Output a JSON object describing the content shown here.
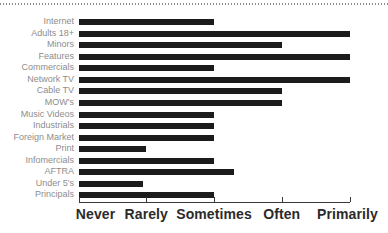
{
  "chart": {
    "type": "barh",
    "title": "",
    "xlabel": "",
    "ylabel": "",
    "grid": false,
    "legend": false
  },
  "chart_data": {
    "type": "bar",
    "orientation": "horizontal",
    "title": "",
    "xlabel": "",
    "ylabel": "",
    "grid": false,
    "legend": null,
    "xlim": [
      0,
      4
    ],
    "xtick_labels": [
      "Never",
      "Rarely",
      "Sometimes",
      "Often",
      "Primarily"
    ],
    "xtick_values": [
      0,
      1,
      2,
      3,
      4
    ],
    "categories": [
      "Internet",
      "Adults 18+",
      "Minors",
      "Features",
      "Commercials",
      "Network TV",
      "Cable TV",
      "MOW's",
      "Music Videos",
      "Industrials",
      "Foreign Market",
      "Print",
      "Infomercials",
      "AFTRA",
      "Under 5's",
      "Principals"
    ],
    "values": [
      2.0,
      4.0,
      3.0,
      4.0,
      2.0,
      4.0,
      3.0,
      3.0,
      2.0,
      2.0,
      2.0,
      1.0,
      2.0,
      2.3,
      0.95,
      2.0
    ],
    "bar_color": "#1b1b1b",
    "label_color": "#8d8d8d",
    "axis_color": "#3a3a3a"
  },
  "decor": {
    "top_rule": "dotted-rule"
  }
}
